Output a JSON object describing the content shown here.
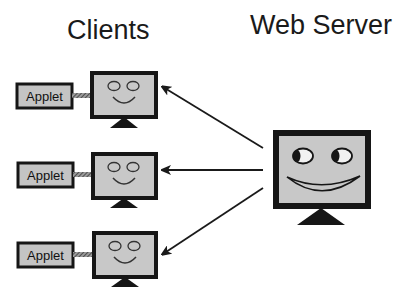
{
  "titles": {
    "clients": "Clients",
    "server": "Web Server"
  },
  "clients": [
    {
      "applet_label": "Applet"
    },
    {
      "applet_label": "Applet"
    },
    {
      "applet_label": "Applet"
    }
  ],
  "colors": {
    "screen_fill": "#c8c8c8",
    "frame": "#161616",
    "applet_fill": "#c4c4c4",
    "arrow": "#1a1a1a"
  }
}
